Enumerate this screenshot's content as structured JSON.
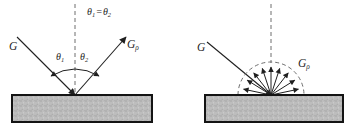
{
  "figure": {
    "colors": {
      "line": "#1f1f1f",
      "dashed_line": "#6e6e6e",
      "surface_fill": "#bdbdbd",
      "surface_speckle": "#9e9e9e",
      "surface_speckle2": "#d2d2d2",
      "surface_border": "#141414",
      "background": "#ffffff"
    },
    "left": {
      "equation": {
        "lhs_base": "θ",
        "lhs_sub": "1",
        "equals": "=",
        "rhs_base": "θ",
        "rhs_sub": "2"
      },
      "incident_label": {
        "base": "G",
        "sub": ""
      },
      "reflected_label": {
        "base": "G",
        "sub": "ρ"
      },
      "angle1": {
        "base": "θ",
        "sub": "1"
      },
      "angle2": {
        "base": "θ",
        "sub": "2"
      }
    },
    "right": {
      "incident_label": {
        "base": "G",
        "sub": ""
      },
      "reflected_label": {
        "base": "G",
        "sub": "ρ"
      }
    }
  }
}
